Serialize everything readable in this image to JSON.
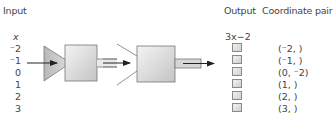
{
  "headers": {
    "input": "Input",
    "output": "Output",
    "coordinate_pair": "Coordinate pair"
  },
  "input_column": {
    "variable": "x",
    "values": [
      "⁻2",
      "⁻1",
      "0",
      "1",
      "2",
      "3"
    ]
  },
  "output_column": {
    "rule": "3x−2",
    "boxes": [
      "",
      "",
      "",
      "",
      "",
      ""
    ]
  },
  "coordinate_pairs": [
    "(⁻2,   )",
    "(⁻1,   )",
    "(0, ⁻2)",
    "(1,    )",
    "(2,    )",
    "(3,    )"
  ],
  "machines": [
    {
      "name": "machine-1",
      "shape": "funnel-triangle-box"
    },
    {
      "name": "machine-2",
      "shape": "open-funnel-box"
    }
  ],
  "colors": {
    "machine_fill_light": "#efefef",
    "machine_fill_dark": "#bdbdbd",
    "stroke": "#6e6e6e",
    "arrow": "#222222"
  }
}
